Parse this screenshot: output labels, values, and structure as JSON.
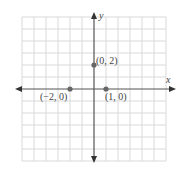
{
  "chart_data": {
    "type": "scatter",
    "title": "",
    "xlabel": "x",
    "ylabel": "y",
    "xlim": [
      -6,
      6
    ],
    "ylim": [
      -6,
      6
    ],
    "grid": true,
    "grid_step": 1,
    "tick_labels_shown": false,
    "points": [
      {
        "x": -2,
        "y": 0,
        "label": "(−2, 0)"
      },
      {
        "x": 1,
        "y": 0,
        "label": "(1, 0)"
      },
      {
        "x": 0,
        "y": 2,
        "label": "(0, 2)"
      }
    ]
  },
  "colors": {
    "grid": "#d9d9d9",
    "axis": "#555555",
    "point": "#666666",
    "text": "#444444"
  },
  "labels": {
    "x_axis": "x",
    "y_axis": "y",
    "p1": "(−2, 0)",
    "p2": "(1, 0)",
    "p3": "(0, 2)"
  }
}
